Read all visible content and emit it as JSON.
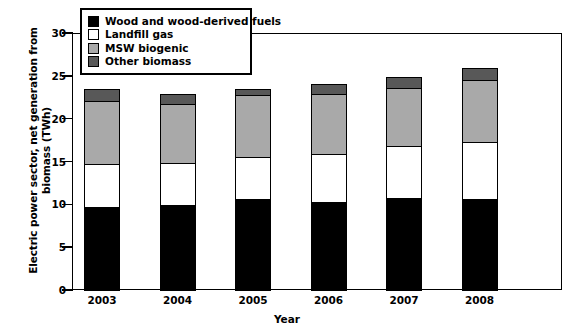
{
  "chart_data": {
    "type": "bar",
    "subtype": "stacked-bar",
    "title": "",
    "xlabel": "Year",
    "ylabel": "Electric power sector, net generation from biomass (TWh)",
    "categories": [
      "2003",
      "2004",
      "2005",
      "2006",
      "2007",
      "2008"
    ],
    "ylim": [
      0,
      30
    ],
    "yticks": [
      0,
      5,
      10,
      15,
      20,
      25,
      30
    ],
    "grid": false,
    "legend_position": "top-left",
    "series": [
      {
        "name": "Wood and wood-derived fuels",
        "color": "#000000",
        "values": [
          9.7,
          9.9,
          10.6,
          10.3,
          10.7,
          10.6
        ]
      },
      {
        "name": "Landfill gas",
        "color": "#ffffff",
        "values": [
          5.0,
          4.9,
          4.9,
          5.6,
          6.1,
          6.7
        ]
      },
      {
        "name": "MSW biogenic",
        "color": "#a9a9a9",
        "values": [
          7.4,
          6.9,
          7.3,
          7.0,
          6.8,
          7.2
        ]
      },
      {
        "name": "Other biomass",
        "color": "#585858",
        "values": [
          1.4,
          1.2,
          0.7,
          1.1,
          1.3,
          1.4
        ]
      }
    ],
    "totals": [
      23.5,
      22.9,
      23.5,
      24.0,
      24.9,
      25.9
    ]
  },
  "axes": {
    "y_title": "Electric power sector, net generation from biomass (TWh)",
    "x_title": "Year",
    "y_tick_labels": [
      "30",
      "25",
      "20",
      "15",
      "10",
      "5",
      "0"
    ],
    "x_tick_labels": [
      "2003",
      "2004",
      "2005",
      "2006",
      "2007",
      "2008"
    ]
  },
  "legend": {
    "items": [
      {
        "label": "Wood and wood-derived fuels",
        "color": "#000000"
      },
      {
        "label": "Landfill gas",
        "color": "#ffffff"
      },
      {
        "label": "MSW biogenic",
        "color": "#a9a9a9"
      },
      {
        "label": "Other biomass",
        "color": "#585858"
      }
    ]
  }
}
